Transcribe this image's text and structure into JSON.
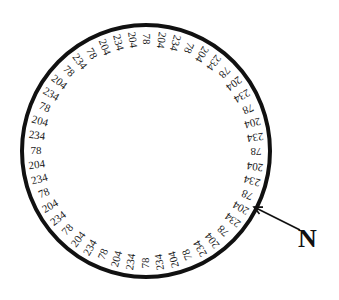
{
  "diagram": {
    "type": "circular-ring-label-diagram",
    "ring": {
      "center": [
        146,
        151
      ],
      "radius_x": 124,
      "radius_y": 126,
      "stroke_color": "#111111",
      "stroke_width": 4
    },
    "label_radius_offset": 14,
    "labels_clockwise_from_top": [
      "78",
      "204",
      "234",
      "78",
      "204",
      "234",
      "78",
      "204",
      "234",
      "78",
      "204",
      "234",
      "78",
      "204",
      "234",
      "78",
      "204",
      "234",
      "78",
      "204",
      "234",
      "78",
      "204",
      "234",
      "78",
      "234",
      "204",
      "78",
      "234",
      "204",
      "78",
      "234",
      "204",
      "78",
      "234",
      "204",
      "78",
      "234",
      "204",
      "78",
      "234",
      "204",
      "78",
      "234",
      "78",
      "204",
      "234",
      "204"
    ],
    "label_values_legend": [
      "78",
      "204",
      "234"
    ],
    "north_marker": {
      "label": "N",
      "arrow_from": [
        300,
        230
      ],
      "arrow_to": [
        254,
        207
      ]
    }
  }
}
